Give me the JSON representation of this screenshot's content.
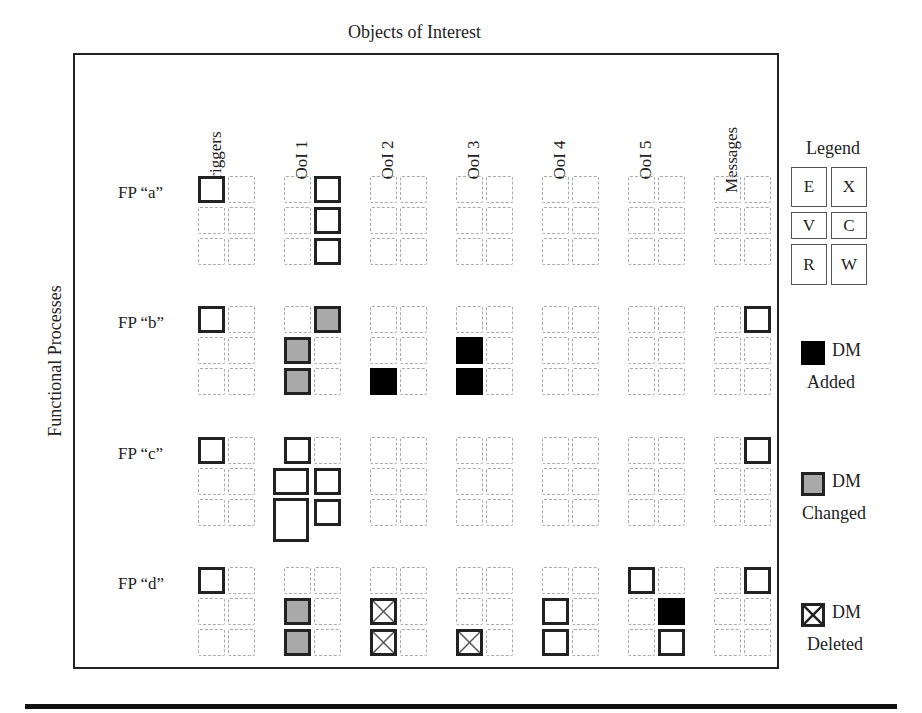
{
  "header": {
    "title": "Objects of Interest"
  },
  "side_label": "Functional Processes",
  "columns": [
    "Triggers",
    "OoI 1",
    "OoI 2",
    "OoI 3",
    "OoI 4",
    "OoI 5",
    "Messages"
  ],
  "rows": [
    "FP “a”",
    "FP “b”",
    "FP “c”",
    "FP “d”"
  ],
  "cell_layout": "Each column x row group is a 3x2 grid of movement slots: [E X / V C / R W]",
  "grid": {
    "FP_a": {
      "Triggers": [
        "solid",
        "empty",
        "empty",
        "empty",
        "empty",
        "empty"
      ],
      "OoI 1": [
        "empty",
        "solid",
        "empty",
        "solid",
        "empty",
        "solid"
      ],
      "OoI 2": [
        "empty",
        "empty",
        "empty",
        "empty",
        "empty",
        "empty"
      ],
      "OoI 3": [
        "empty",
        "empty",
        "empty",
        "empty",
        "empty",
        "empty"
      ],
      "OoI 4": [
        "empty",
        "empty",
        "empty",
        "empty",
        "empty",
        "empty"
      ],
      "OoI 5": [
        "empty",
        "empty",
        "empty",
        "empty",
        "empty",
        "empty"
      ],
      "Messages": [
        "empty",
        "empty",
        "empty",
        "empty",
        "empty",
        "empty"
      ]
    },
    "FP_b": {
      "Triggers": [
        "solid",
        "empty",
        "empty",
        "empty",
        "empty",
        "empty"
      ],
      "OoI 1": [
        "empty",
        "changed",
        "changed",
        "empty",
        "changed",
        "empty"
      ],
      "OoI 2": [
        "empty",
        "empty",
        "empty",
        "empty",
        "added",
        "empty"
      ],
      "OoI 3": [
        "empty",
        "empty",
        "added",
        "empty",
        "added",
        "empty"
      ],
      "OoI 4": [
        "empty",
        "empty",
        "empty",
        "empty",
        "empty",
        "empty"
      ],
      "OoI 5": [
        "empty",
        "empty",
        "empty",
        "empty",
        "empty",
        "empty"
      ],
      "Messages": [
        "empty",
        "solid",
        "empty",
        "empty",
        "empty",
        "empty"
      ]
    },
    "FP_c": {
      "Triggers": [
        "solid",
        "empty",
        "empty",
        "empty",
        "empty",
        "empty"
      ],
      "OoI 1": [
        "solid",
        "empty",
        "solid-wide",
        "solid",
        "solid-large",
        "solid"
      ],
      "OoI 2": [
        "empty",
        "empty",
        "empty",
        "empty",
        "empty",
        "empty"
      ],
      "OoI 3": [
        "empty",
        "empty",
        "empty",
        "empty",
        "empty",
        "empty"
      ],
      "OoI 4": [
        "empty",
        "empty",
        "empty",
        "empty",
        "empty",
        "empty"
      ],
      "OoI 5": [
        "empty",
        "empty",
        "empty",
        "empty",
        "empty",
        "empty"
      ],
      "Messages": [
        "empty",
        "solid",
        "empty",
        "empty",
        "empty",
        "empty"
      ]
    },
    "FP_d": {
      "Triggers": [
        "solid",
        "empty",
        "empty",
        "empty",
        "empty",
        "empty"
      ],
      "OoI 1": [
        "empty",
        "empty",
        "changed",
        "empty",
        "changed",
        "empty"
      ],
      "OoI 2": [
        "empty",
        "empty",
        "deleted",
        "empty",
        "deleted",
        "empty"
      ],
      "OoI 3": [
        "empty",
        "empty",
        "empty",
        "empty",
        "deleted",
        "empty"
      ],
      "OoI 4": [
        "empty",
        "empty",
        "solid",
        "empty",
        "solid",
        "empty"
      ],
      "OoI 5": [
        "solid",
        "empty",
        "empty",
        "added",
        "empty",
        "solid"
      ],
      "Messages": [
        "empty",
        "solid",
        "empty",
        "empty",
        "empty",
        "empty"
      ]
    }
  },
  "legend": {
    "title": "Legend",
    "keys": [
      "E",
      "X",
      "V",
      "C",
      "R",
      "W"
    ],
    "items": [
      {
        "symbol": "added",
        "line1": "DM",
        "line2": "Added"
      },
      {
        "symbol": "changed",
        "line1": "DM",
        "line2": "Changed"
      },
      {
        "symbol": "deleted",
        "line1": "DM",
        "line2": "Deleted"
      }
    ]
  },
  "colors": {
    "added": "#000000",
    "changed": "#a9a9a9",
    "empty_border": "#aaaaaa",
    "solid_border": "#222222"
  }
}
